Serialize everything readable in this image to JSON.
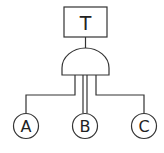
{
  "diagram": {
    "type": "fault-tree",
    "top_event": {
      "label": "T"
    },
    "gate": {
      "type": "AND"
    },
    "basic_events": [
      {
        "label": "A"
      },
      {
        "label": "B"
      },
      {
        "label": "C"
      }
    ],
    "stroke_color": "#333333"
  }
}
